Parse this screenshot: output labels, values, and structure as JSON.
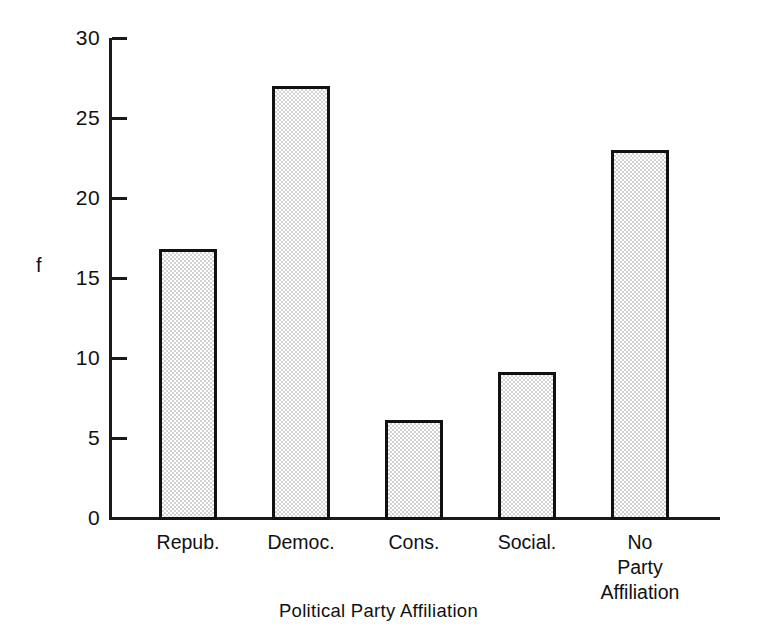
{
  "chart_data": {
    "type": "bar",
    "title": "",
    "subtitle": "",
    "xlabel": "Political Party Affiliation",
    "ylabel": "f",
    "categories": [
      "Repub.",
      "Democ.",
      "Cons.",
      "Social.",
      "No\nParty\nAffiliation"
    ],
    "values": [
      16.8,
      27,
      6.1,
      9.1,
      23
    ],
    "ylim": [
      0,
      30
    ],
    "yticks": [
      0,
      5,
      10,
      15,
      20,
      25,
      30
    ],
    "ytick_labels": [
      "0",
      "5",
      "10",
      "15",
      "20",
      "25",
      "30"
    ],
    "grid": false,
    "legend": null,
    "legend_position": "none",
    "bar_fill_color": "#d2d2d2",
    "bar_edge_color": "#111111",
    "background_color": "#ffffff"
  },
  "axes": {
    "y_axis_title": "f",
    "x_axis_title": "Political Party Affiliation"
  },
  "bars": [
    {
      "label": "Repub.",
      "value": 16.8
    },
    {
      "label": "Democ.",
      "value": 27
    },
    {
      "label": "Cons.",
      "value": 6.1
    },
    {
      "label": "Social.",
      "value": 9.1
    },
    {
      "label": "No\nParty\nAffiliation",
      "value": 23
    }
  ]
}
